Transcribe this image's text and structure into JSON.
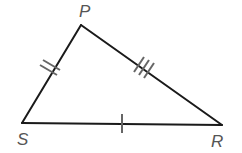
{
  "diagram": {
    "type": "triangle",
    "colors": {
      "sides": "#1a1a1a",
      "ticks": "#666666",
      "labels": "#555555"
    },
    "vertices": [
      {
        "name": "P",
        "x": 81,
        "y": 25,
        "label_x": 79,
        "label_y": 3
      },
      {
        "name": "S",
        "x": 22,
        "y": 123,
        "label_x": 17,
        "label_y": 131
      },
      {
        "name": "R",
        "x": 222,
        "y": 125,
        "label_x": 211,
        "label_y": 133
      }
    ],
    "sides": [
      {
        "name": "PS",
        "tick_marks": 2
      },
      {
        "name": "PR",
        "tick_marks": 3
      },
      {
        "name": "SR",
        "tick_marks": 1
      }
    ]
  }
}
